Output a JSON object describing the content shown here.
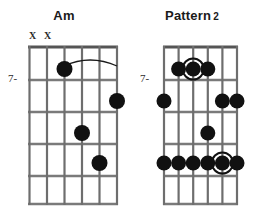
{
  "page": {
    "kind": "guitar-chord-diagram-sheet",
    "background_color": "#ffffff",
    "width": 256,
    "height": 217
  },
  "palette": {
    "dot_fill": "#111111",
    "ring_stroke": "#111111",
    "string_color": "#6e6e6e",
    "fret_color": "#7a7a7a",
    "nut_color": "#555555",
    "text_color": "#1a1a1a"
  },
  "diagrams": [
    {
      "id": "am",
      "title": "Am",
      "title_suffix": "",
      "position_label": "7-",
      "position_fret_index": 2,
      "strings": 6,
      "frets": 5,
      "mute_marks": [
        {
          "string": 1,
          "glyph": "X"
        },
        {
          "string": 2,
          "glyph": "X"
        }
      ],
      "dots": [
        {
          "string": 3,
          "fret": 1,
          "root": false
        },
        {
          "string": 6,
          "fret": 2,
          "root": false
        },
        {
          "string": 4,
          "fret": 3,
          "root": false
        },
        {
          "string": 5,
          "fret": 4,
          "root": false
        }
      ],
      "slur": {
        "from_string": 3,
        "to_string": 6,
        "fret": 1,
        "present": true
      }
    },
    {
      "id": "pattern-2",
      "title": "Pattern",
      "title_suffix": "2",
      "position_label": "7-",
      "position_fret_index": 2,
      "strings": 6,
      "frets": 5,
      "mute_marks": [],
      "dots": [
        {
          "string": 2,
          "fret": 1,
          "root": false
        },
        {
          "string": 3,
          "fret": 1,
          "root": true
        },
        {
          "string": 4,
          "fret": 1,
          "root": false
        },
        {
          "string": 1,
          "fret": 2,
          "root": false
        },
        {
          "string": 5,
          "fret": 2,
          "root": false
        },
        {
          "string": 6,
          "fret": 2,
          "root": false
        },
        {
          "string": 4,
          "fret": 4,
          "root": false
        },
        {
          "string": 1,
          "fret": 5,
          "root": false
        },
        {
          "string": 2,
          "fret": 5,
          "root": false
        },
        {
          "string": 3,
          "fret": 5,
          "root": false
        },
        {
          "string": 4,
          "fret": 5,
          "root": false
        },
        {
          "string": 5,
          "fret": 5,
          "root": true
        },
        {
          "string": 6,
          "fret": 5,
          "root": false
        }
      ],
      "slur": {
        "present": false
      }
    }
  ]
}
